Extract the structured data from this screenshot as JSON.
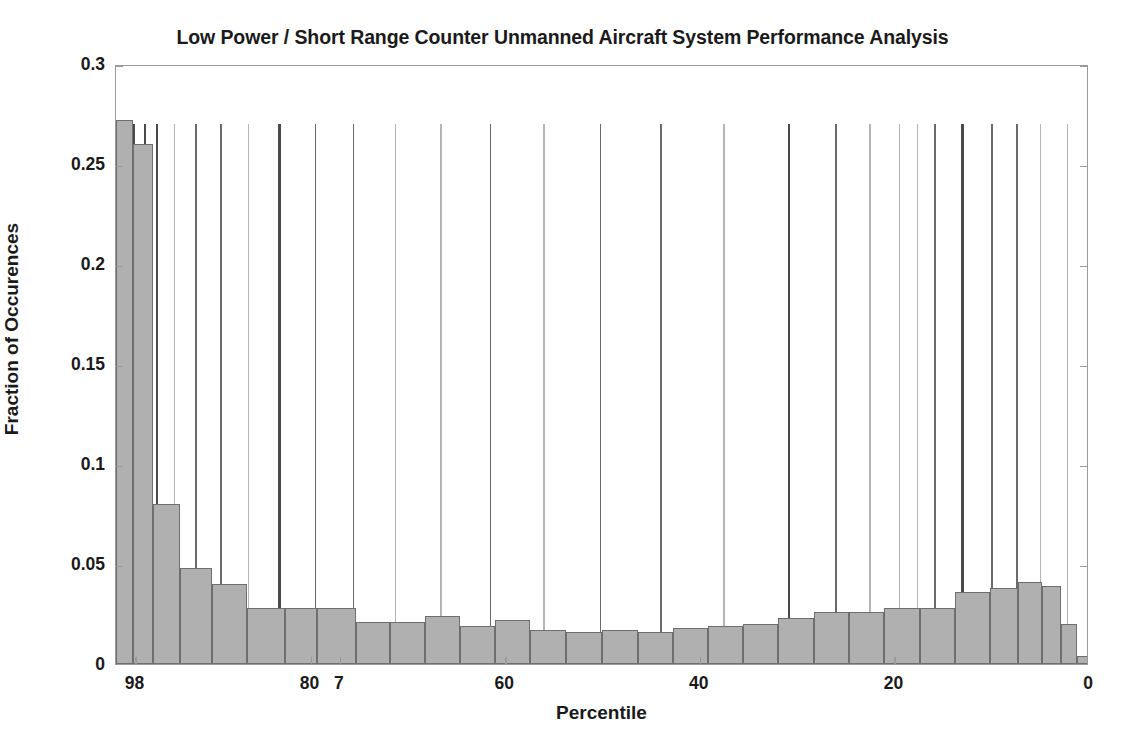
{
  "chart_data": {
    "type": "bar",
    "title": "Low Power / Short Range Counter Unmanned Aircraft System Performance Analysis",
    "xlabel": "Percentile",
    "ylabel": "Fraction of Occurences",
    "xlim": [
      100,
      0
    ],
    "ylim": [
      0,
      0.3
    ],
    "x_axis_inverted": true,
    "grid": false,
    "legend": null,
    "yticks": [
      0,
      0.05,
      0.1,
      0.15,
      0.2,
      0.25,
      0.3
    ],
    "ytick_labels": [
      "0",
      "0.05",
      "0.1",
      "0.15",
      "0.2",
      "0.25",
      "0.3"
    ],
    "xticks": [
      98,
      80,
      77,
      60,
      40,
      20,
      0
    ],
    "xtick_labels": [
      "98",
      "80",
      "7",
      "60",
      "40",
      "20",
      "0"
    ],
    "xtick_labels_overlapping_note": "98/80/7 overlap at left edge",
    "bar_face_color": "#b0b0b0",
    "bar_edge_color": "#6e6e6e",
    "marker_line_color": "#555555",
    "marker_line_top_value": 0.27,
    "bin_centers": [
      99.0,
      97.0,
      95.0,
      93.0,
      91.0,
      89.0,
      87.0,
      85.0,
      83.0,
      81.0,
      79.0,
      77.0,
      75.0,
      73.0,
      71.0,
      69.0,
      67.0,
      65.0,
      63.0,
      61.0,
      59.0,
      57.0,
      55.0,
      53.0,
      51.0,
      49.0,
      47.0,
      45.0,
      43.0,
      41.0,
      39.0,
      37.0,
      35.0,
      33.0,
      31.0,
      29.0,
      27.0,
      25.0,
      23.0,
      21.0,
      19.0,
      17.0,
      15.0,
      13.0,
      11.0,
      9.0,
      7.0,
      5.0,
      3.0,
      1.0
    ],
    "categories": [
      "99",
      "97",
      "95",
      "93",
      "91",
      "89",
      "87",
      "85",
      "83",
      "81",
      "79",
      "77",
      "75",
      "73",
      "71",
      "69",
      "67",
      "65",
      "63",
      "61",
      "59",
      "57",
      "55",
      "53",
      "51",
      "49",
      "47",
      "45",
      "43",
      "41",
      "39",
      "37",
      "35",
      "33",
      "31",
      "29",
      "27",
      "25",
      "23",
      "21",
      "19",
      "17",
      "15",
      "13",
      "11",
      "9",
      "7",
      "5",
      "3",
      "1"
    ],
    "values": [
      0.272,
      0.272,
      0.26,
      0.26,
      0.08,
      0.08,
      0.048,
      0.048,
      0.04,
      0.04,
      0.028,
      0.028,
      0.028,
      0.028,
      0.021,
      0.021,
      0.021,
      0.024,
      0.024,
      0.019,
      0.019,
      0.022,
      0.022,
      0.017,
      0.017,
      0.016,
      0.016,
      0.017,
      0.018,
      0.017,
      0.017,
      0.019,
      0.019,
      0.02,
      0.02,
      0.023,
      0.023,
      0.026,
      0.026,
      0.024,
      0.028,
      0.028,
      0.028,
      0.028,
      0.036,
      0.037,
      0.038,
      0.041,
      0.039,
      0.02
    ],
    "bars": [
      {
        "x0": 100.0,
        "x1": 98.3,
        "value": 0.272
      },
      {
        "x0": 98.3,
        "x1": 96.2,
        "value": 0.26
      },
      {
        "x0": 96.2,
        "x1": 93.4,
        "value": 0.08
      },
      {
        "x0": 93.4,
        "x1": 90.1,
        "value": 0.048
      },
      {
        "x0": 90.1,
        "x1": 86.5,
        "value": 0.04
      },
      {
        "x0": 86.5,
        "x1": 82.6,
        "value": 0.028
      },
      {
        "x0": 82.6,
        "x1": 79.3,
        "value": 0.028
      },
      {
        "x0": 79.3,
        "x1": 75.3,
        "value": 0.028
      },
      {
        "x0": 75.3,
        "x1": 71.8,
        "value": 0.021
      },
      {
        "x0": 71.8,
        "x1": 68.2,
        "value": 0.021
      },
      {
        "x0": 68.2,
        "x1": 64.6,
        "value": 0.024
      },
      {
        "x0": 64.6,
        "x1": 61.0,
        "value": 0.019
      },
      {
        "x0": 61.0,
        "x1": 57.4,
        "value": 0.022
      },
      {
        "x0": 57.4,
        "x1": 53.7,
        "value": 0.017
      },
      {
        "x0": 53.7,
        "x1": 50.1,
        "value": 0.016
      },
      {
        "x0": 50.1,
        "x1": 46.4,
        "value": 0.017
      },
      {
        "x0": 46.4,
        "x1": 42.8,
        "value": 0.016
      },
      {
        "x0": 42.8,
        "x1": 39.2,
        "value": 0.018
      },
      {
        "x0": 39.2,
        "x1": 35.6,
        "value": 0.019
      },
      {
        "x0": 35.6,
        "x1": 32.0,
        "value": 0.02
      },
      {
        "x0": 32.0,
        "x1": 28.3,
        "value": 0.023
      },
      {
        "x0": 28.3,
        "x1": 24.7,
        "value": 0.026
      },
      {
        "x0": 24.7,
        "x1": 21.1,
        "value": 0.026
      },
      {
        "x0": 21.1,
        "x1": 17.4,
        "value": 0.028
      },
      {
        "x0": 17.4,
        "x1": 13.8,
        "value": 0.028
      },
      {
        "x0": 13.8,
        "x1": 10.2,
        "value": 0.036
      },
      {
        "x0": 10.2,
        "x1": 7.3,
        "value": 0.038
      },
      {
        "x0": 7.3,
        "x1": 4.8,
        "value": 0.041
      },
      {
        "x0": 4.8,
        "x1": 2.9,
        "value": 0.039
      },
      {
        "x0": 2.9,
        "x1": 1.2,
        "value": 0.02
      },
      {
        "x0": 1.2,
        "x1": 0.0,
        "value": 0.004
      }
    ],
    "marker_lines": [
      {
        "x": 99.7,
        "weight": "heavy"
      },
      {
        "x": 99.0,
        "weight": "heavy"
      },
      {
        "x": 98.2,
        "weight": "heavy"
      },
      {
        "x": 97.0,
        "weight": "heavy"
      },
      {
        "x": 95.8,
        "weight": "heavy"
      },
      {
        "x": 94.0,
        "weight": "light"
      },
      {
        "x": 91.8,
        "weight": "medium"
      },
      {
        "x": 89.2,
        "weight": "medium"
      },
      {
        "x": 86.4,
        "weight": "light"
      },
      {
        "x": 83.2,
        "weight": "heavy"
      },
      {
        "x": 79.5,
        "weight": "medium"
      },
      {
        "x": 75.6,
        "weight": "medium"
      },
      {
        "x": 71.3,
        "weight": "light"
      },
      {
        "x": 66.6,
        "weight": "light"
      },
      {
        "x": 61.5,
        "weight": "medium"
      },
      {
        "x": 56.0,
        "weight": "light"
      },
      {
        "x": 50.2,
        "weight": "medium"
      },
      {
        "x": 44.0,
        "weight": "medium"
      },
      {
        "x": 37.5,
        "weight": "light"
      },
      {
        "x": 30.8,
        "weight": "heavy"
      },
      {
        "x": 26.0,
        "weight": "medium"
      },
      {
        "x": 22.5,
        "weight": "light"
      },
      {
        "x": 19.5,
        "weight": "light"
      },
      {
        "x": 17.6,
        "weight": "light"
      },
      {
        "x": 15.8,
        "weight": "medium"
      },
      {
        "x": 13.0,
        "weight": "heavy"
      },
      {
        "x": 10.0,
        "weight": "medium"
      },
      {
        "x": 7.4,
        "weight": "medium"
      },
      {
        "x": 5.0,
        "weight": "light"
      },
      {
        "x": 2.2,
        "weight": "light"
      }
    ]
  }
}
